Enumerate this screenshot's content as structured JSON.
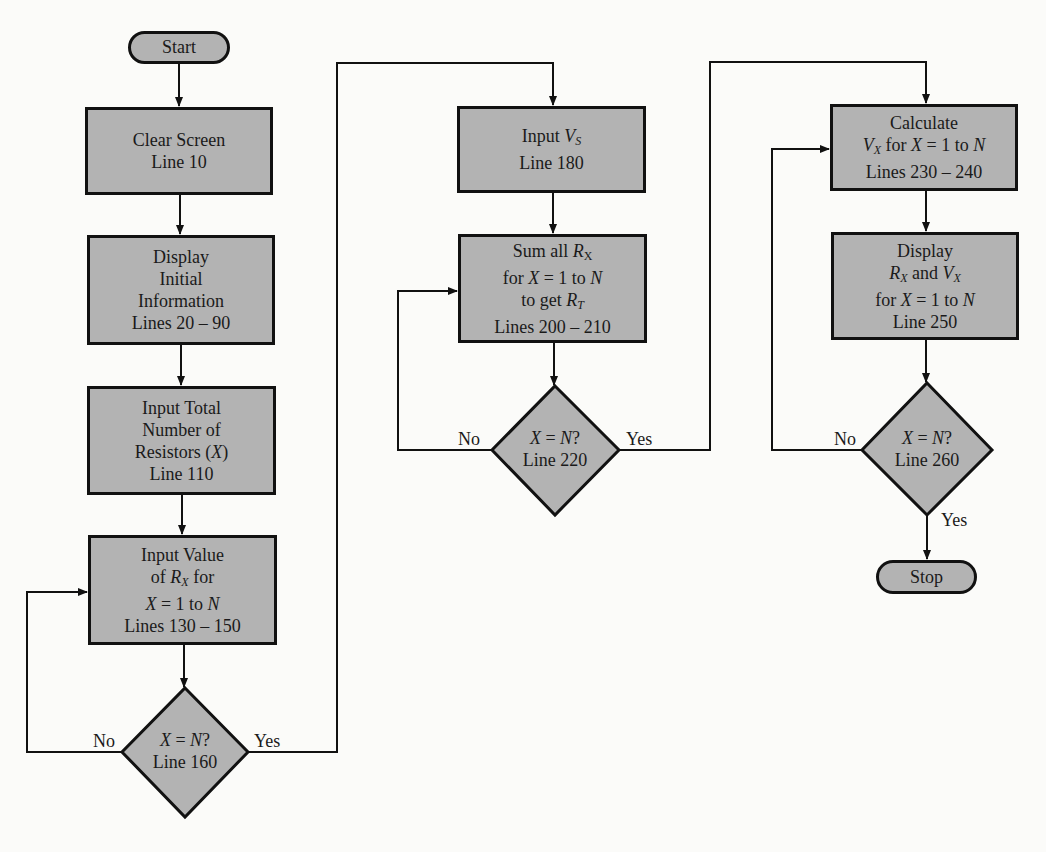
{
  "diagram": {
    "type": "flowchart",
    "colors": {
      "shape_fill": "#b3b3b3",
      "stroke": "#111111",
      "background": "#fbfbf9"
    },
    "start": {
      "label": "Start"
    },
    "stop": {
      "label": "Stop"
    },
    "column1": [
      {
        "id": "clear",
        "lines": [
          "Clear Screen",
          "Line 10"
        ]
      },
      {
        "id": "display-initial",
        "lines": [
          "Display",
          "Initial",
          "Information",
          "Lines 20 – 90"
        ]
      },
      {
        "id": "input-total",
        "lines": [
          "Input Total",
          "Number of",
          "Resistors (X)",
          "Line 110"
        ]
      },
      {
        "id": "input-value",
        "lines": [
          "Input Value",
          "of R_X for",
          "X = 1 to N",
          "Lines 130 – 150"
        ]
      }
    ],
    "decision1": {
      "lines": [
        "X = N?",
        "Line 160"
      ],
      "no": "No",
      "yes": "Yes"
    },
    "column2": [
      {
        "id": "input-vs",
        "lines": [
          "Input V_S",
          "Line 180"
        ]
      },
      {
        "id": "sum-rx",
        "lines": [
          "Sum all R_X",
          "for X = 1 to N",
          "to get R_T",
          "Lines 200 – 210"
        ]
      }
    ],
    "decision2": {
      "lines": [
        "X = N?",
        "Line 220"
      ],
      "no": "No",
      "yes": "Yes"
    },
    "column3": [
      {
        "id": "calc-vx",
        "lines": [
          "Calculate",
          "V_X for X = 1 to N",
          "Lines 230 – 240"
        ]
      },
      {
        "id": "display-rx-vx",
        "lines": [
          "Display",
          "R_X and V_X",
          "for X = 1 to N",
          "Line 250"
        ]
      }
    ],
    "decision3": {
      "lines": [
        "X = N?",
        "Line 260"
      ],
      "no": "No",
      "yes": "Yes"
    }
  }
}
